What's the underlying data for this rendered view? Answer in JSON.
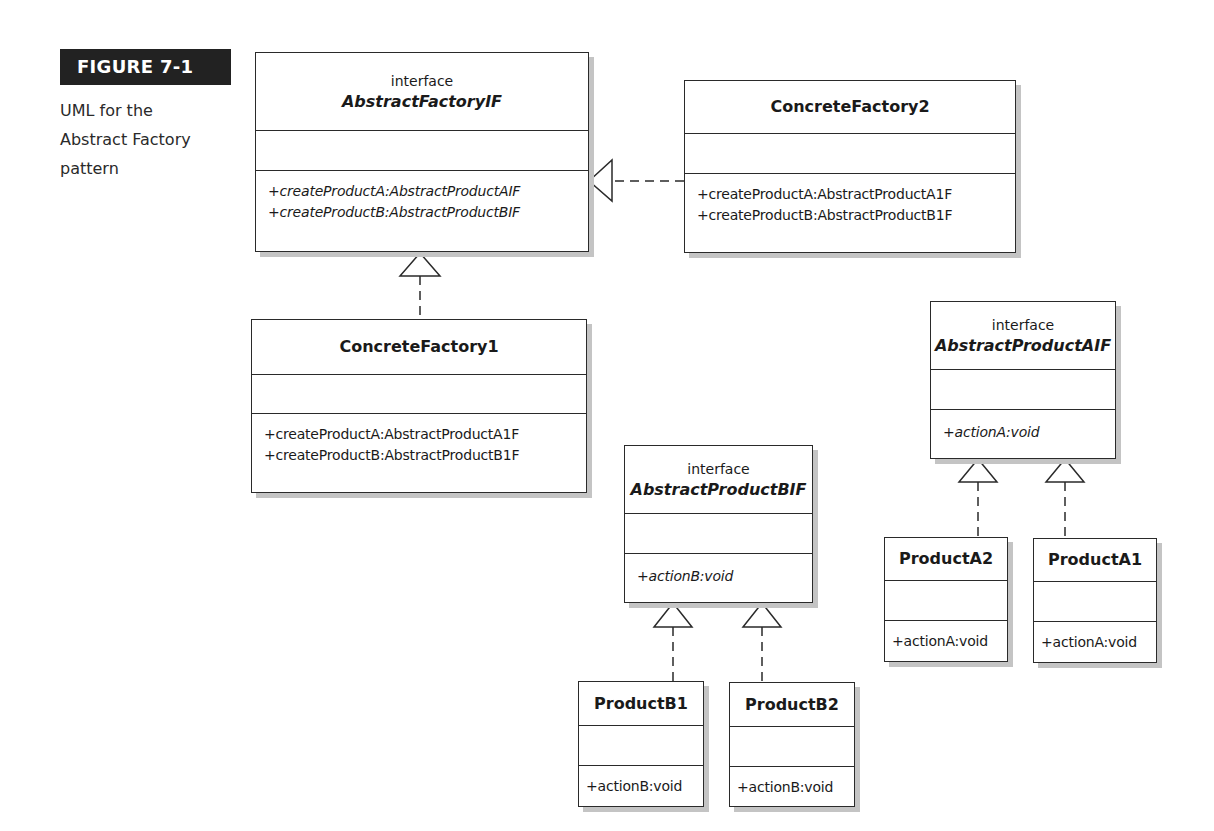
{
  "figure": {
    "label": "FIGURE 7-1",
    "caption_lines": [
      "UML for the",
      "Abstract Factory",
      "pattern"
    ]
  },
  "classes": {
    "abstract_factory": {
      "stereotype": "interface",
      "name": "AbstractFactoryIF",
      "operations": [
        "+createProductA:AbstractProductAIF",
        "+createProductB:AbstractProductBIF"
      ]
    },
    "concrete_factory_2": {
      "name": "ConcreteFactory2",
      "operations": [
        "+createProductA:AbstractProductA1F",
        "+createProductB:AbstractProductB1F"
      ]
    },
    "concrete_factory_1": {
      "name": "ConcreteFactory1",
      "operations": [
        "+createProductA:AbstractProductA1F",
        "+createProductB:AbstractProductB1F"
      ]
    },
    "abstract_product_b": {
      "stereotype": "interface",
      "name": "AbstractProductBIF",
      "operations": [
        "+actionB:void"
      ]
    },
    "product_b1": {
      "name": "ProductB1",
      "operations": [
        "+actionB:void"
      ]
    },
    "product_b2": {
      "name": "ProductB2",
      "operations": [
        "+actionB:void"
      ]
    },
    "abstract_product_a": {
      "stereotype": "interface",
      "name": "AbstractProductAIF",
      "operations": [
        "+actionA:void"
      ]
    },
    "product_a2": {
      "name": "ProductA2",
      "operations": [
        "+actionA:void"
      ]
    },
    "product_a1": {
      "name": "ProductA1",
      "operations": [
        "+actionA:void"
      ]
    }
  },
  "relationships": [
    {
      "from": "ConcreteFactory2",
      "to": "AbstractFactoryIF",
      "type": "realization"
    },
    {
      "from": "ConcreteFactory1",
      "to": "AbstractFactoryIF",
      "type": "realization"
    },
    {
      "from": "ProductB1",
      "to": "AbstractProductBIF",
      "type": "realization"
    },
    {
      "from": "ProductB2",
      "to": "AbstractProductBIF",
      "type": "realization"
    },
    {
      "from": "ProductA2",
      "to": "AbstractProductAIF",
      "type": "realization"
    },
    {
      "from": "ProductA1",
      "to": "AbstractProductAIF",
      "type": "realization"
    }
  ]
}
